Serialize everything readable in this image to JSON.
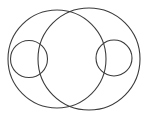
{
  "figure": {
    "width": 146,
    "height": 118,
    "background_color": "#ffffff",
    "stroke_color": "#3a3a3a",
    "stroke_color_secondary": "#4a4a4a",
    "caption": ""
  },
  "chart_data": {
    "type": "diagram",
    "subtype": "venn-like-circle-arrangement",
    "units": "pixels",
    "coordinate_origin": "top-left",
    "shapes": [
      {
        "name": "large-left-circle",
        "kind": "circle",
        "cx": 57,
        "cy": 59,
        "r": 49,
        "stroke": "#3f3f3f",
        "stroke_width": 1.1,
        "fill": "none"
      },
      {
        "name": "large-right-circle",
        "kind": "circle",
        "cx": 89,
        "cy": 59,
        "r": 51,
        "stroke": "#3a3a3a",
        "stroke_width": 1.1,
        "fill": "none"
      },
      {
        "name": "small-left-circle",
        "kind": "circle",
        "cx": 29,
        "cy": 59,
        "r": 18.5,
        "stroke": "#3f3f3f",
        "stroke_width": 1.1,
        "fill": "none"
      },
      {
        "name": "small-right-circle",
        "kind": "circle",
        "cx": 114,
        "cy": 58,
        "r": 18,
        "stroke": "#3a3a3a",
        "stroke_width": 1.1,
        "fill": "none"
      }
    ],
    "relations": [
      "large-left-circle and large-right-circle intersect at two points near (68,13) and (72,104)",
      "small-left-circle is inscribed tangentially inside large-left-circle at its left side",
      "small-right-circle is inscribed tangentially inside large-right-circle at its right side",
      "small-left-circle crosses the left boundary arc of large-right-circle"
    ],
    "labels": [],
    "legend": [],
    "grid": false
  }
}
